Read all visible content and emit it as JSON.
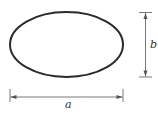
{
  "diagram": {
    "shape": "ellipse",
    "labels": {
      "width": "a",
      "height": "b"
    },
    "colors": {
      "stroke": "#2a2a2a",
      "dimension": "#555555",
      "background": "#ffffff"
    }
  }
}
